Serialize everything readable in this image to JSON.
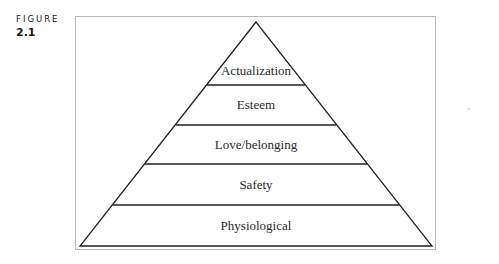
{
  "figure": {
    "label_word": "FIGURE",
    "label_number": "2.1"
  },
  "pyramid": {
    "levels": [
      {
        "name": "Actualization"
      },
      {
        "name": "Esteem"
      },
      {
        "name": "Love/belonging"
      },
      {
        "name": "Safety"
      },
      {
        "name": "Physiological"
      }
    ]
  }
}
